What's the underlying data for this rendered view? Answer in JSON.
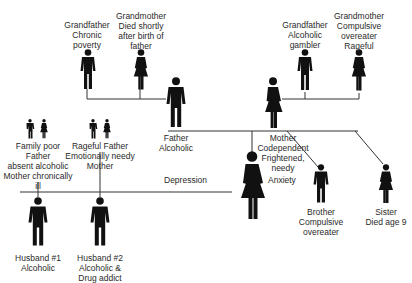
{
  "diagram": {
    "type": "family-genogram",
    "paternal_grandfather": {
      "role": "Grandfather",
      "lines": [
        "Grandfather",
        "Chronic",
        "poverty"
      ]
    },
    "paternal_grandmother": {
      "role": "Grandmother",
      "lines": [
        "Grandmother",
        "Died shortly",
        "after birth of",
        "father"
      ]
    },
    "maternal_grandfather": {
      "role": "Grandfather",
      "lines": [
        "Grandfather",
        "Alcoholic",
        "gambler"
      ]
    },
    "maternal_grandmother": {
      "role": "Grandmother",
      "lines": [
        "Grandmother",
        "Compulsive",
        "overeater",
        "Rageful"
      ]
    },
    "father": {
      "role": "Father",
      "lines": [
        "Father",
        "Alcoholic"
      ]
    },
    "mother": {
      "role": "Mother",
      "lines": [
        "Mother",
        "Codependent",
        "Frightened,",
        "needy"
      ]
    },
    "patient": {
      "left_trait": "Depression",
      "right_trait": "Anxiety"
    },
    "brother": {
      "role": "Brother",
      "lines": [
        "Brother",
        "Compulsive",
        "overeater"
      ]
    },
    "sister": {
      "role": "Sister",
      "lines": [
        "Sister",
        "Died age 9"
      ]
    },
    "husband1_family": {
      "lines": [
        "Family poor",
        "Father",
        "absent alcoholic",
        "Mother chronically",
        "ill"
      ]
    },
    "husband2_family": {
      "lines": [
        "Rageful Father",
        "Emotionally needy",
        "Mother"
      ]
    },
    "husband1": {
      "role": "Husband #1",
      "lines": [
        "Husband #1",
        "Alcoholic"
      ]
    },
    "husband2": {
      "role": "Husband #2",
      "lines": [
        "Husband #2",
        "Alcoholic &",
        "Drug addict"
      ]
    },
    "colors": {
      "figure": "#111111",
      "line": "#333333",
      "text": "#2a2a2a",
      "background": "#ffffff"
    }
  }
}
